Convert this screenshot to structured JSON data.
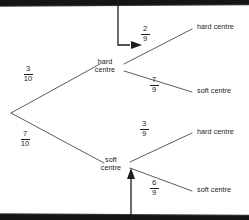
{
  "diagram": {
    "type": "probability-tree",
    "root": {
      "label": ""
    },
    "first_stage": [
      {
        "id": "hard",
        "label_line1": "hard",
        "label_line2": "centre",
        "probability": {
          "numerator": "3",
          "denominator": "10",
          "text": "3/10"
        }
      },
      {
        "id": "soft",
        "label_line1": "soft",
        "label_line2": "centre",
        "probability": {
          "numerator": "7",
          "denominator": "10",
          "text": "7/10"
        }
      }
    ],
    "second_stage": [
      {
        "parent": "hard",
        "label": "hard centre",
        "probability": {
          "numerator": "2",
          "denominator": "9",
          "text": "2/9"
        }
      },
      {
        "parent": "hard",
        "label": "soft centre",
        "probability": {
          "numerator": "7",
          "denominator": "9",
          "text": "7/9"
        }
      },
      {
        "parent": "soft",
        "label": "hard centre",
        "probability": {
          "numerator": "3",
          "denominator": "9",
          "text": "3/9"
        }
      },
      {
        "parent": "soft",
        "label": "soft centre",
        "probability": {
          "numerator": "6",
          "denominator": "9",
          "text": "6/9"
        }
      }
    ],
    "annotations": [
      {
        "id": "top-callout",
        "shape": "elbow-arrow",
        "direction": "down-then-right",
        "points_to": "2/9"
      },
      {
        "id": "bottom-callout",
        "shape": "straight-arrow",
        "direction": "up",
        "points_to": "soft centre node"
      }
    ],
    "colors": {
      "line": "#4a4a4a",
      "arrow": "#1d1d1d",
      "text": "#1d1d1d",
      "bar": "#151515",
      "background": "#ffffff"
    }
  }
}
